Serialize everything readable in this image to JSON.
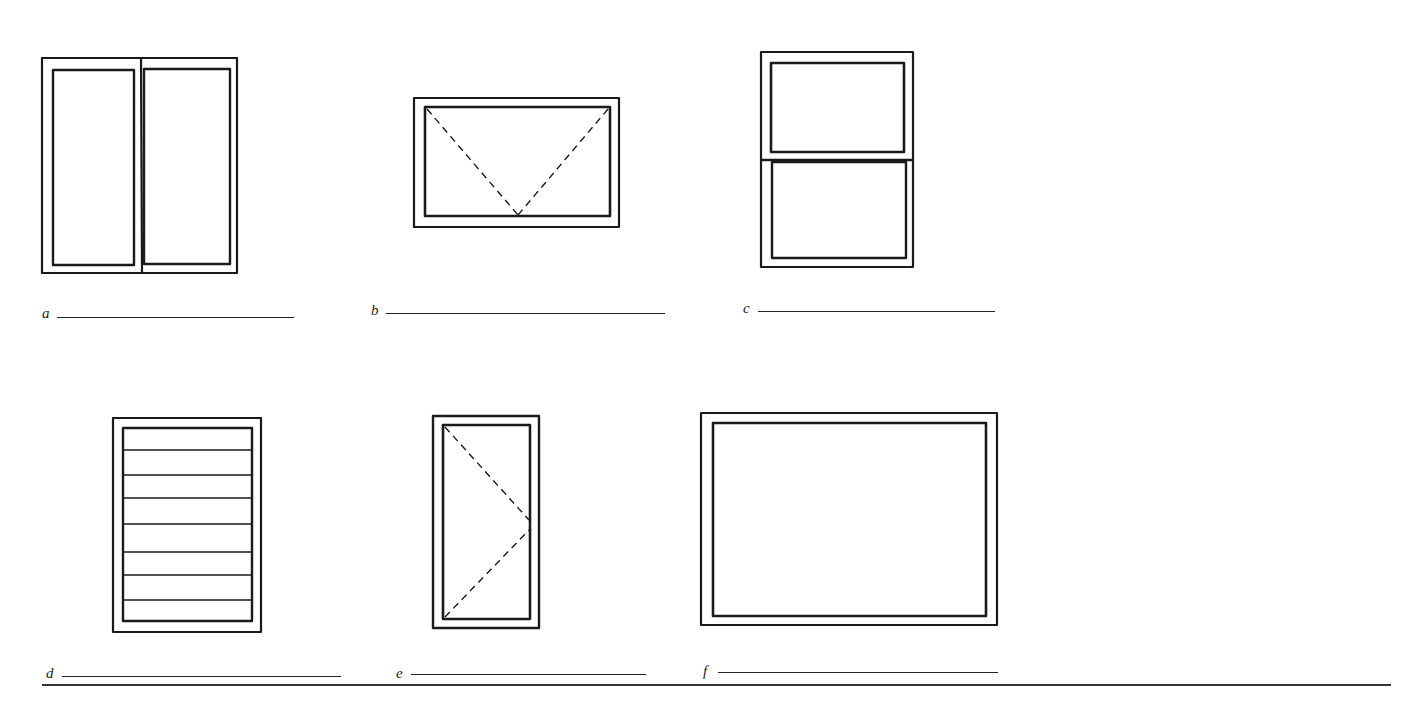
{
  "figure": {
    "type": "window-types-identification-worksheet",
    "items": [
      {
        "id": "a",
        "label": "a",
        "drawing": "two-side-by-side-sashes",
        "answer": ""
      },
      {
        "id": "b",
        "label": "b",
        "drawing": "single-sash-dashed-v-pointing-down",
        "answer": ""
      },
      {
        "id": "c",
        "label": "c",
        "drawing": "two-stacked-sashes",
        "answer": ""
      },
      {
        "id": "d",
        "label": "d",
        "drawing": "horizontal-louvered-slats",
        "answer": ""
      },
      {
        "id": "e",
        "label": "e",
        "drawing": "single-sash-dashed-v-pointing-right",
        "answer": ""
      },
      {
        "id": "f",
        "label": "f",
        "drawing": "single-fixed-pane",
        "answer": ""
      }
    ],
    "colors": {
      "stroke": "#1a1a1a",
      "background": "#ffffff"
    }
  }
}
